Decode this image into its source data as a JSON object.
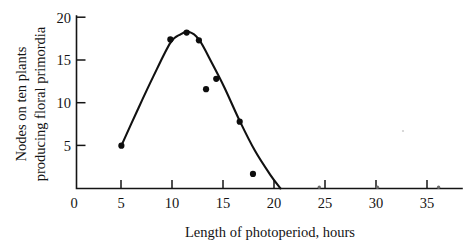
{
  "chart_data": {
    "type": "scatter",
    "title": "",
    "xlabel": "Length of photoperiod, hours",
    "ylabel_line1": "Nodes on ten plants",
    "ylabel_line2": "producing floral primordia",
    "xlim": [
      0,
      38.5
    ],
    "ylim": [
      0,
      20.5
    ],
    "xticks": [
      0,
      5,
      10,
      15,
      20,
      25,
      30,
      35
    ],
    "xticklabels": [
      "0",
      "5",
      "10",
      "15",
      "20",
      "25",
      "30",
      "35"
    ],
    "yticks": [
      5,
      10,
      15,
      20
    ],
    "yticklabels": [
      "5",
      "10",
      "15",
      "20"
    ],
    "grid": false,
    "legend": null,
    "points": [
      {
        "x": 4.4,
        "y": 5.0
      },
      {
        "x": 9.2,
        "y": 17.4
      },
      {
        "x": 10.8,
        "y": 18.2
      },
      {
        "x": 12.0,
        "y": 17.3
      },
      {
        "x": 12.7,
        "y": 11.6
      },
      {
        "x": 13.7,
        "y": 12.8
      },
      {
        "x": 16.0,
        "y": 7.8
      },
      {
        "x": 17.3,
        "y": 1.7
      },
      {
        "x": 23.8,
        "y": 0.0
      },
      {
        "x": 29.5,
        "y": 0.0
      },
      {
        "x": 35.5,
        "y": 0.0
      }
    ],
    "fitted_curve": [
      {
        "x": 4.4,
        "y": 5.0
      },
      {
        "x": 6.0,
        "y": 9.2
      },
      {
        "x": 7.5,
        "y": 13.0
      },
      {
        "x": 9.2,
        "y": 17.0
      },
      {
        "x": 10.2,
        "y": 18.0
      },
      {
        "x": 11.0,
        "y": 18.3
      },
      {
        "x": 12.0,
        "y": 17.4
      },
      {
        "x": 13.3,
        "y": 14.6
      },
      {
        "x": 14.5,
        "y": 11.8
      },
      {
        "x": 16.0,
        "y": 7.9
      },
      {
        "x": 17.5,
        "y": 4.4
      },
      {
        "x": 19.0,
        "y": 1.6
      },
      {
        "x": 20.0,
        "y": 0.0
      }
    ]
  },
  "axis": {
    "x_title": "Length of photoperiod, hours",
    "y_title_line1": "Nodes on ten plants",
    "y_title_line2": "producing floral primordia"
  }
}
